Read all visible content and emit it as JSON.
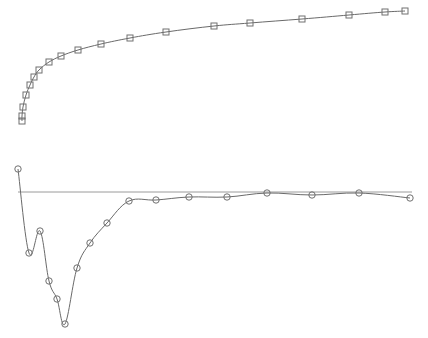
{
  "chart_data": {
    "type": "line",
    "title": "",
    "xlabel": "",
    "ylabel": "",
    "axes_visible": false,
    "grid": false,
    "legend": null,
    "colors": {
      "line": "#6a6a6a",
      "marker": "#707070",
      "zero_line": "#9a9a9a",
      "background": "#ffffff"
    },
    "series": [
      {
        "name": "upper-series",
        "marker": "square",
        "points_px": [
          [
            22,
            121
          ],
          [
            22,
            116
          ],
          [
            23,
            107
          ],
          [
            26,
            95
          ],
          [
            30,
            85
          ],
          [
            34,
            77
          ],
          [
            39,
            70
          ],
          [
            49,
            62
          ],
          [
            61,
            56
          ],
          [
            78,
            50
          ],
          [
            101,
            44
          ],
          [
            130,
            38
          ],
          [
            166,
            32
          ],
          [
            214,
            26
          ],
          [
            250,
            23
          ],
          [
            302,
            19
          ],
          [
            349,
            15
          ],
          [
            385,
            12
          ],
          [
            405,
            11
          ]
        ]
      },
      {
        "name": "lower-series",
        "marker": "circle",
        "points_px": [
          [
            18,
            169
          ],
          [
            29,
            253
          ],
          [
            40,
            231
          ],
          [
            49,
            281
          ],
          [
            57,
            299
          ],
          [
            65,
            324
          ],
          [
            77,
            268
          ],
          [
            90,
            243
          ],
          [
            107,
            223
          ],
          [
            129,
            201
          ],
          [
            156,
            200
          ],
          [
            189,
            197
          ],
          [
            227,
            197
          ],
          [
            267,
            193
          ],
          [
            312,
            195
          ],
          [
            359,
            193
          ],
          [
            410,
            198
          ]
        ]
      }
    ],
    "reference_line": {
      "name": "zero-line",
      "y_px": 192,
      "x_start_px": 18,
      "x_end_px": 412
    }
  }
}
